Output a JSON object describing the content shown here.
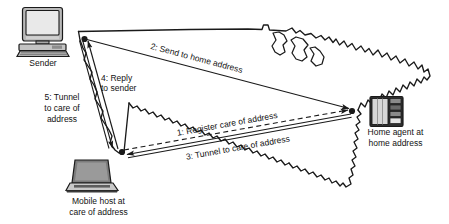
{
  "diagram": {
    "background_color": "#ffffff",
    "line_color": "#1a1a1a",
    "map": {
      "name": "united-states-outline",
      "stroke": "#1a1a1a",
      "fill": "none"
    },
    "nodes": [
      {
        "id": "sender",
        "label": "Sender",
        "icon": "desktop-computer-icon",
        "device_type": "desktop computer"
      },
      {
        "id": "home-agent",
        "label_line1": "Home agent at",
        "label_line2": "home address",
        "icon": "server-tower-icon",
        "device_type": "server"
      },
      {
        "id": "mobile-host",
        "label_line1": "Mobile host at",
        "label_line2": "care of address",
        "icon": "laptop-icon",
        "device_type": "laptop"
      }
    ],
    "flows": [
      {
        "number": "1",
        "label": "1: Register care of address",
        "from": "mobile-host",
        "to": "home-agent",
        "style": "dashed"
      },
      {
        "number": "2",
        "label": "2: Send to home address",
        "from": "sender",
        "to": "home-agent",
        "style": "solid"
      },
      {
        "number": "3",
        "label": "3: Tunnel to care of address",
        "from": "home-agent",
        "to": "mobile-host",
        "style": "double-solid-tunnel"
      },
      {
        "number": "4",
        "label_line1": "4: Reply",
        "label_line2": "to sender",
        "from": "mobile-host",
        "to": "sender",
        "style": "solid"
      },
      {
        "number": "5",
        "label_line1": "5: Tunnel",
        "label_line2": "to care of",
        "label_line3": "address",
        "from": "sender",
        "to": "mobile-host",
        "style": "double-solid-tunnel"
      }
    ]
  }
}
